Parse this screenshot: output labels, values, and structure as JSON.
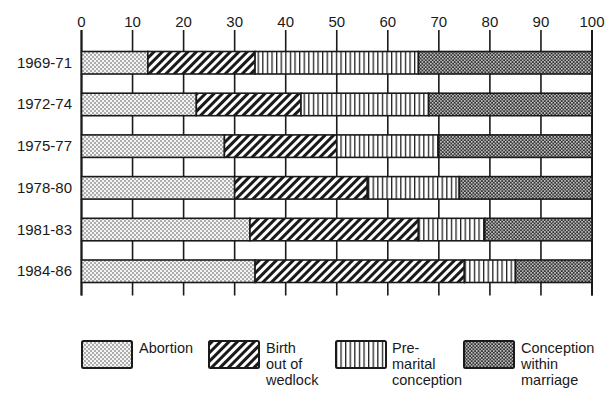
{
  "chart_data": {
    "type": "bar",
    "orientation": "horizontal",
    "stacked": true,
    "title": "",
    "xlabel": "",
    "ylabel": "",
    "xlim": [
      0,
      100
    ],
    "x_ticks": [
      0,
      10,
      20,
      30,
      40,
      50,
      60,
      70,
      80,
      90,
      100
    ],
    "x_tick_labels": [
      "0",
      "10",
      "20",
      "30",
      "40",
      "50",
      "60",
      "70",
      "80",
      "90",
      "100"
    ],
    "x_axis_position": "top",
    "grid": false,
    "legend_position": "bottom",
    "categories": [
      "1969-71",
      "1972-74",
      "1975-77",
      "1978-80",
      "1981-83",
      "1984-86"
    ],
    "series": [
      {
        "name": "Abortion",
        "pattern": "dots",
        "values": [
          13,
          22.5,
          28,
          30,
          33,
          34
        ]
      },
      {
        "name": "Birth out of wedlock",
        "pattern": "diagonal-hatch",
        "values": [
          21,
          20.5,
          22,
          26,
          33,
          41
        ]
      },
      {
        "name": "Pre-marital conception",
        "pattern": "vertical-lines",
        "values": [
          32,
          25,
          20,
          18,
          13,
          10
        ]
      },
      {
        "name": "Conception within marriage",
        "pattern": "cross-hatch",
        "values": [
          34,
          32,
          30,
          26,
          21,
          15
        ]
      }
    ]
  },
  "legend": [
    {
      "label": "Abortion",
      "pattern": "dots"
    },
    {
      "label": "Birth\nout of\nwedlock",
      "pattern": "diagonal-hatch"
    },
    {
      "label": "Pre-\nmarital\nconception",
      "pattern": "vertical-lines"
    },
    {
      "label": "Conception\nwithin\nmarriage",
      "pattern": "cross-hatch"
    }
  ],
  "colors": {
    "ink": "#1a1a1a",
    "background": "#ffffff"
  }
}
